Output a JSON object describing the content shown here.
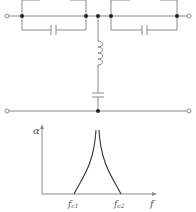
{
  "diagram": {
    "type": "circuit-and-response",
    "circuit": {
      "description": "Band-stop filter: two series parallel-LC branches with a shunt series-LC branch",
      "components": [
        {
          "id": "L1",
          "kind": "inductor",
          "position": "top-left series branch"
        },
        {
          "id": "C1",
          "kind": "capacitor",
          "position": "bottom-left series branch"
        },
        {
          "id": "L2",
          "kind": "inductor",
          "position": "top-right series branch"
        },
        {
          "id": "C2",
          "kind": "capacitor",
          "position": "bottom-right series branch"
        },
        {
          "id": "L3",
          "kind": "inductor",
          "position": "shunt vertical"
        },
        {
          "id": "C3",
          "kind": "capacitor",
          "position": "shunt vertical"
        }
      ],
      "terminals": 4
    },
    "plot": {
      "y_label": "α",
      "x_label": "f",
      "tick_labels": [
        "f_{c1}",
        "f_{c2}"
      ],
      "fc1_main": "f",
      "fc1_sub": "c1",
      "fc2_main": "f",
      "fc2_sub": "c2"
    },
    "colors": {
      "line": "#8a8a8a",
      "dot": "#222222",
      "text": "#555555"
    }
  }
}
